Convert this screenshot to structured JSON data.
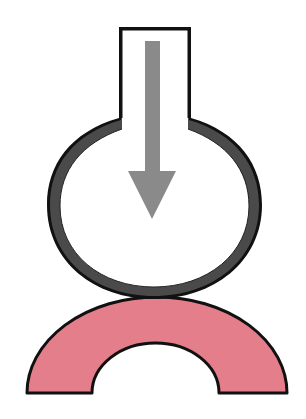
{
  "diagram": {
    "elements": [
      {
        "id": "vessel",
        "label": "",
        "shape": "flask (neck + round bulb)",
        "icon": "flask-icon"
      },
      {
        "id": "arrow",
        "label": "",
        "direction": "down",
        "icon": "arrow-down-icon"
      },
      {
        "id": "arch",
        "label": "",
        "shape": "half-ring arch",
        "icon": "arch-icon"
      }
    ],
    "colors": {
      "background": "#ffffff",
      "outline": "#111111",
      "bulb_ring": "#4a4a4a",
      "arrow": "#8a8a8a",
      "arch_fill": "#e47e8a"
    }
  }
}
